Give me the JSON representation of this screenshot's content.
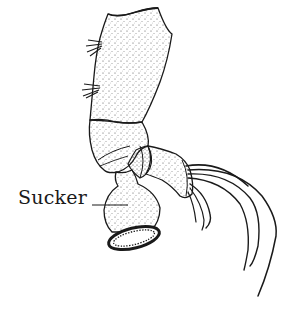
{
  "figure": {
    "labels": [
      {
        "text": "Sucker",
        "target": "sucker"
      }
    ]
  },
  "colors": {
    "ink": "#1a1a1a",
    "background": "#ffffff"
  }
}
